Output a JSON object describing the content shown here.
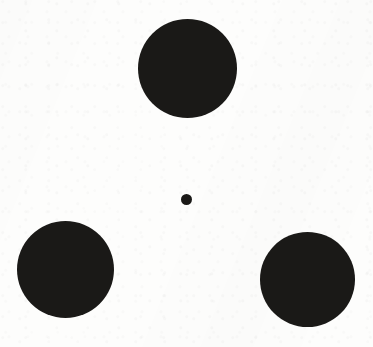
{
  "figure": {
    "background_color": "#fdfdfc",
    "ink_color": "#1a1917",
    "width": 373,
    "height": 347,
    "shapes": [
      {
        "name": "top-large-circle",
        "shape": "circle",
        "center_x": 187,
        "center_y": 68,
        "diameter": 99,
        "color": "#1a1917"
      },
      {
        "name": "bottom-left-large-circle",
        "shape": "circle",
        "center_x": 65,
        "center_y": 269,
        "diameter": 97,
        "color": "#1a1917"
      },
      {
        "name": "bottom-right-large-circle",
        "shape": "circle",
        "center_x": 307,
        "center_y": 279,
        "diameter": 95,
        "color": "#1a1917"
      },
      {
        "name": "center-small-dot",
        "shape": "circle",
        "center_x": 186,
        "center_y": 199,
        "diameter": 11,
        "color": "#1a1917"
      }
    ]
  }
}
